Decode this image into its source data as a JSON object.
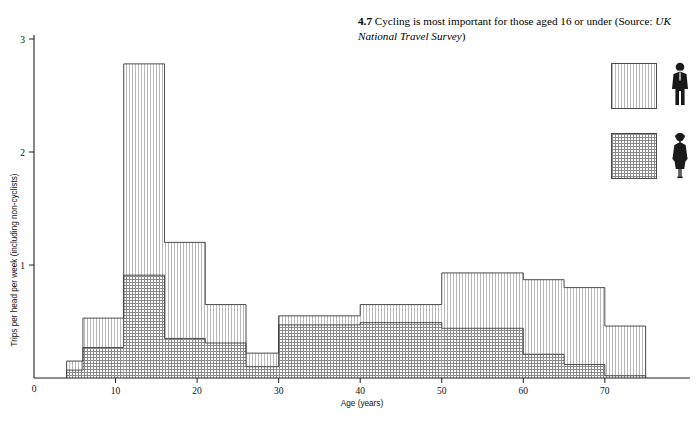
{
  "caption": {
    "number": "4.7",
    "text": "Cycling is most important for those aged 16 or under (Source:",
    "source_italic": "UK National Travel Survey",
    "closing": ")"
  },
  "legend": {
    "items": [
      {
        "label": "male",
        "pattern": "vertical-stripes",
        "icon": "man-pictogram-icon"
      },
      {
        "label": "female",
        "pattern": "cross-hatch",
        "icon": "woman-pictogram-icon"
      }
    ]
  },
  "axes": {
    "x_label": "Age (years)",
    "y_label": "Trips per head per week (including non-cyclists)",
    "x_ticks": [
      "0",
      "10",
      "20",
      "30",
      "40",
      "50",
      "60",
      "70"
    ],
    "y_ticks": [
      "0",
      "1",
      "2",
      "3"
    ]
  },
  "chart_data": {
    "type": "bar",
    "title": "Cycling is most important for those aged 16 or under",
    "subtitle": "Source: UK National Travel Survey",
    "xlabel": "Age (years)",
    "ylabel": "Trips per head per week (including non-cyclists)",
    "xlim": [
      0,
      76
    ],
    "ylim": [
      0,
      3
    ],
    "xticks": [
      0,
      10,
      20,
      30,
      40,
      50,
      60,
      70
    ],
    "yticks": [
      0,
      1,
      2,
      3
    ],
    "grid": false,
    "legend_position": "top-right",
    "stacked": true,
    "bin_edges": [
      4,
      6,
      11,
      16,
      21,
      26,
      30,
      40,
      50,
      60,
      65,
      70,
      75
    ],
    "bin_labels": [
      "4-6",
      "6-11",
      "11-16",
      "16-21",
      "21-26",
      "26-30",
      "30-40",
      "40-50",
      "50-60",
      "60-65",
      "65-70",
      "70-75"
    ],
    "series": [
      {
        "name": "female",
        "pattern": "cross-hatch",
        "values": [
          0.07,
          0.27,
          0.91,
          0.35,
          0.31,
          0.1,
          0.47,
          0.49,
          0.44,
          0.21,
          0.12,
          0.02
        ]
      },
      {
        "name": "male",
        "pattern": "vertical-stripes",
        "values": [
          0.08,
          0.26,
          1.87,
          0.85,
          0.34,
          0.12,
          0.08,
          0.16,
          0.49,
          0.66,
          0.68,
          0.44
        ]
      }
    ],
    "totals": [
      0.15,
      0.53,
      2.78,
      1.2,
      0.65,
      0.22,
      0.55,
      0.65,
      0.93,
      0.87,
      0.8,
      0.46
    ]
  }
}
